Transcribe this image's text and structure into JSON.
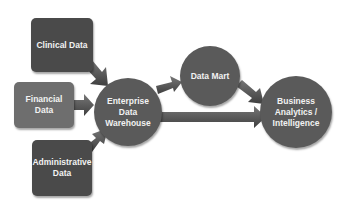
{
  "diagram": {
    "sources": [
      {
        "id": "clinical",
        "label": "Clinical Data",
        "color": "#4a4a4a"
      },
      {
        "id": "financial",
        "label": "Financial Data",
        "color": "#6e6e6e"
      },
      {
        "id": "administrative",
        "label": "Administrative\nData",
        "color": "#4a4a4a"
      }
    ],
    "hub": {
      "label": "Enterprise\nData\nWarehouse",
      "color": "#5a5a5a"
    },
    "mart": {
      "label": "Data Mart",
      "color": "#5a5a5a"
    },
    "target": {
      "label": "Business\nAnalytics /\nIntelligence",
      "color": "#5a5a5a"
    },
    "edges": [
      {
        "from": "Clinical Data",
        "to": "Enterprise Data Warehouse"
      },
      {
        "from": "Financial Data",
        "to": "Enterprise Data Warehouse"
      },
      {
        "from": "Administrative Data",
        "to": "Enterprise Data Warehouse"
      },
      {
        "from": "Enterprise Data Warehouse",
        "to": "Data Mart"
      },
      {
        "from": "Data Mart",
        "to": "Business Analytics / Intelligence"
      },
      {
        "from": "Enterprise Data Warehouse",
        "to": "Business Analytics / Intelligence"
      }
    ],
    "arrow_color": "#555555"
  }
}
